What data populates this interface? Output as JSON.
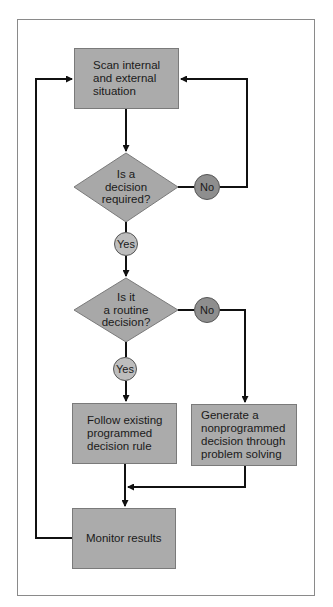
{
  "diagram": {
    "type": "flowchart",
    "colors": {
      "box_fill": "#ababab",
      "diamond_fill": "#a8a8a8",
      "no_circle_fill": "#8e8e8e",
      "yes_circle_fill": "#bdbdbd",
      "line": "#111111",
      "frame": "#8a8a8a"
    },
    "nodes": {
      "scan": {
        "label": "Scan internal\nand external\nsituation"
      },
      "decision_required": {
        "label": "Is a\ndecision\nrequired?"
      },
      "routine_decision": {
        "label": "Is it\na routine\ndecision?"
      },
      "follow_rule": {
        "label": "Follow existing\nprogrammed\ndecision rule"
      },
      "generate": {
        "label": "Generate a\nnonprogrammed\ndecision through\nproblem solving"
      },
      "monitor": {
        "label": "Monitor results"
      }
    },
    "branches": {
      "d1_no": "No",
      "d1_yes": "Yes",
      "d2_no": "No",
      "d2_yes": "Yes"
    }
  }
}
